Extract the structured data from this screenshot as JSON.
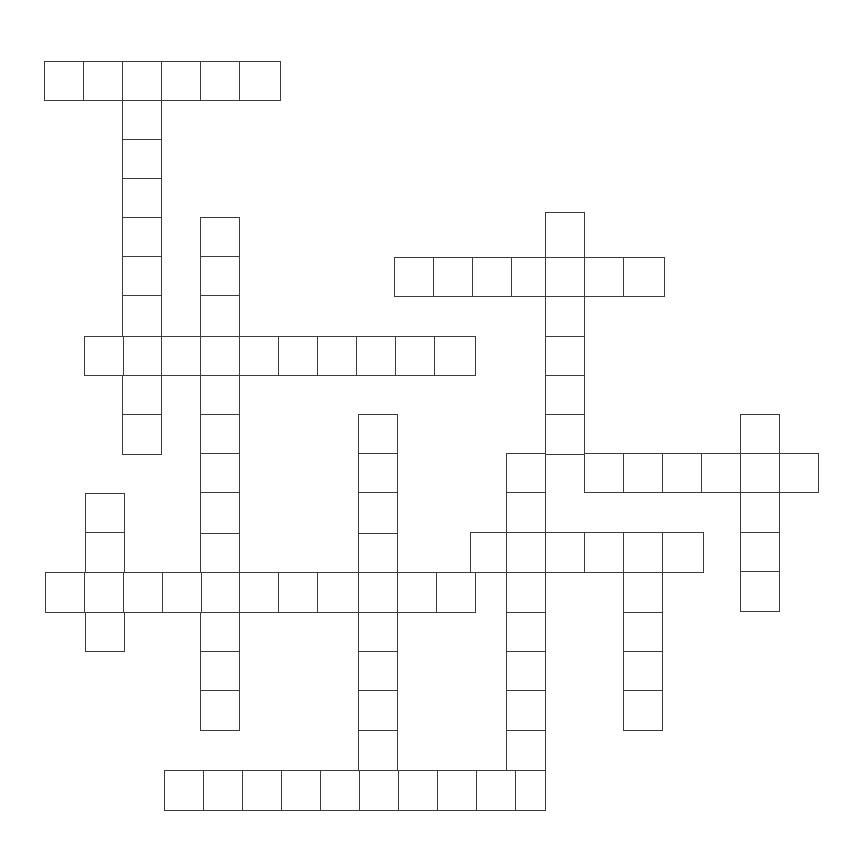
{
  "puzzle": {
    "type": "crossword-grid",
    "title": "Crossword Puzzle Grid",
    "description": "Blank crossword puzzle skeleton with interlocking across and down entries",
    "canvas": {
      "width": 855,
      "height": 854
    },
    "geometry": {
      "cell_size": 39.4,
      "origin_x": 44,
      "origin_y": 61,
      "line_color": "#3a3a3a",
      "cell_fill": "#ffffff",
      "page_background": "#ffffff",
      "border_width": 1.4
    },
    "counts": {
      "across_entries": 7,
      "down_entries": 9,
      "total_cells": 109
    },
    "entries": [
      {
        "id": "a1",
        "direction": "across",
        "col": 0,
        "row": 0,
        "length": 6,
        "x": 44,
        "y": 61
      },
      {
        "id": "a2",
        "direction": "across",
        "col": 9,
        "row": 5,
        "length": 7,
        "x": 398,
        "y": 258
      },
      {
        "id": "a3",
        "direction": "across",
        "col": 1,
        "row": 7,
        "length": 10,
        "x": 84,
        "y": 337
      },
      {
        "id": "a4",
        "direction": "across",
        "col": 12,
        "row": 10,
        "length": 8,
        "x": 516,
        "y": 455
      },
      {
        "id": "a5",
        "direction": "across",
        "col": 11,
        "row": 12,
        "length": 6,
        "x": 477,
        "y": 534
      },
      {
        "id": "a6",
        "direction": "across",
        "col": 0,
        "row": 13,
        "length": 11,
        "x": 44,
        "y": 573
      },
      {
        "id": "a7",
        "direction": "across",
        "col": 3,
        "row": 18,
        "length": 10,
        "x": 162,
        "y": 770
      },
      {
        "id": "d1",
        "direction": "down",
        "col": 2,
        "row": 0,
        "length": 10,
        "x": 122,
        "y": 61
      },
      {
        "id": "d2",
        "direction": "down",
        "col": 4,
        "row": 4,
        "length": 13,
        "x": 201,
        "y": 218
      },
      {
        "id": "d3",
        "direction": "down",
        "col": 13,
        "row": 4,
        "length": 14,
        "x": 516,
        "y": 218
      },
      {
        "id": "d4",
        "direction": "down",
        "col": 8,
        "row": 9,
        "length": 10,
        "x": 359,
        "y": 416
      },
      {
        "id": "d5",
        "direction": "down",
        "col": 18,
        "row": 9,
        "length": 5,
        "x": 753,
        "y": 416
      },
      {
        "id": "d6",
        "direction": "down",
        "col": 1,
        "row": 11,
        "length": 4,
        "x": 84,
        "y": 494
      },
      {
        "id": "d7",
        "direction": "down",
        "col": 15,
        "row": 13,
        "length": 6,
        "x": 595,
        "y": 573
      }
    ],
    "cells": [
      {
        "x": 44,
        "y": 61,
        "w": 40,
        "h": 40
      },
      {
        "x": 83,
        "y": 61,
        "w": 40,
        "h": 40
      },
      {
        "x": 122,
        "y": 61,
        "w": 40,
        "h": 40
      },
      {
        "x": 161,
        "y": 61,
        "w": 40,
        "h": 40
      },
      {
        "x": 200,
        "y": 61,
        "w": 40,
        "h": 40
      },
      {
        "x": 239,
        "y": 61,
        "w": 42,
        "h": 40
      },
      {
        "x": 122,
        "y": 100,
        "w": 40,
        "h": 40
      },
      {
        "x": 122,
        "y": 139,
        "w": 40,
        "h": 40
      },
      {
        "x": 122,
        "y": 178,
        "w": 40,
        "h": 40
      },
      {
        "x": 122,
        "y": 217,
        "w": 40,
        "h": 40
      },
      {
        "x": 122,
        "y": 256,
        "w": 40,
        "h": 40
      },
      {
        "x": 122,
        "y": 295,
        "w": 40,
        "h": 42
      },
      {
        "x": 122,
        "y": 336,
        "w": 40,
        "h": 40
      },
      {
        "x": 122,
        "y": 375,
        "w": 40,
        "h": 40
      },
      {
        "x": 122,
        "y": 414,
        "w": 40,
        "h": 41
      },
      {
        "x": 200,
        "y": 217,
        "w": 40,
        "h": 40
      },
      {
        "x": 200,
        "y": 256,
        "w": 40,
        "h": 40
      },
      {
        "x": 200,
        "y": 295,
        "w": 40,
        "h": 42
      },
      {
        "x": 200,
        "y": 336,
        "w": 40,
        "h": 40
      },
      {
        "x": 200,
        "y": 375,
        "w": 40,
        "h": 40
      },
      {
        "x": 200,
        "y": 414,
        "w": 40,
        "h": 40
      },
      {
        "x": 200,
        "y": 453,
        "w": 40,
        "h": 40
      },
      {
        "x": 200,
        "y": 492,
        "w": 40,
        "h": 42
      },
      {
        "x": 200,
        "y": 533,
        "w": 40,
        "h": 40
      },
      {
        "x": 200,
        "y": 572,
        "w": 40,
        "h": 41
      },
      {
        "x": 200,
        "y": 612,
        "w": 40,
        "h": 40
      },
      {
        "x": 200,
        "y": 651,
        "w": 40,
        "h": 40
      },
      {
        "x": 200,
        "y": 690,
        "w": 40,
        "h": 41
      },
      {
        "x": 394,
        "y": 257,
        "w": 40,
        "h": 40
      },
      {
        "x": 433,
        "y": 257,
        "w": 40,
        "h": 40
      },
      {
        "x": 472,
        "y": 257,
        "w": 40,
        "h": 40
      },
      {
        "x": 511,
        "y": 257,
        "w": 40,
        "h": 40
      },
      {
        "x": 545,
        "y": 257,
        "w": 40,
        "h": 40
      },
      {
        "x": 584,
        "y": 257,
        "w": 40,
        "h": 40
      },
      {
        "x": 623,
        "y": 257,
        "w": 42,
        "h": 40
      },
      {
        "x": 545,
        "y": 212,
        "w": 40,
        "h": 46
      },
      {
        "x": 545,
        "y": 296,
        "w": 40,
        "h": 41
      },
      {
        "x": 545,
        "y": 336,
        "w": 40,
        "h": 40
      },
      {
        "x": 545,
        "y": 375,
        "w": 40,
        "h": 40
      },
      {
        "x": 545,
        "y": 414,
        "w": 40,
        "h": 41
      },
      {
        "x": 84,
        "y": 336,
        "w": 40,
        "h": 40
      },
      {
        "x": 161,
        "y": 336,
        "w": 40,
        "h": 40
      },
      {
        "x": 239,
        "y": 336,
        "w": 40,
        "h": 40
      },
      {
        "x": 278,
        "y": 336,
        "w": 40,
        "h": 40
      },
      {
        "x": 317,
        "y": 336,
        "w": 40,
        "h": 40
      },
      {
        "x": 356,
        "y": 336,
        "w": 40,
        "h": 40
      },
      {
        "x": 395,
        "y": 336,
        "w": 40,
        "h": 40
      },
      {
        "x": 434,
        "y": 336,
        "w": 42,
        "h": 40
      },
      {
        "x": 358,
        "y": 414,
        "w": 40,
        "h": 41
      },
      {
        "x": 358,
        "y": 453,
        "w": 40,
        "h": 40
      },
      {
        "x": 358,
        "y": 492,
        "w": 40,
        "h": 42
      },
      {
        "x": 358,
        "y": 533,
        "w": 40,
        "h": 40
      },
      {
        "x": 358,
        "y": 572,
        "w": 40,
        "h": 41
      },
      {
        "x": 358,
        "y": 612,
        "w": 40,
        "h": 40
      },
      {
        "x": 358,
        "y": 651,
        "w": 40,
        "h": 40
      },
      {
        "x": 358,
        "y": 690,
        "w": 40,
        "h": 41
      },
      {
        "x": 358,
        "y": 730,
        "w": 40,
        "h": 41
      },
      {
        "x": 506,
        "y": 453,
        "w": 40,
        "h": 40
      },
      {
        "x": 584,
        "y": 453,
        "w": 40,
        "h": 40
      },
      {
        "x": 623,
        "y": 453,
        "w": 40,
        "h": 40
      },
      {
        "x": 662,
        "y": 453,
        "w": 40,
        "h": 40
      },
      {
        "x": 701,
        "y": 453,
        "w": 40,
        "h": 40
      },
      {
        "x": 740,
        "y": 453,
        "w": 40,
        "h": 40
      },
      {
        "x": 779,
        "y": 453,
        "w": 40,
        "h": 40
      },
      {
        "x": 740,
        "y": 414,
        "w": 40,
        "h": 40
      },
      {
        "x": 740,
        "y": 492,
        "w": 40,
        "h": 41
      },
      {
        "x": 740,
        "y": 532,
        "w": 40,
        "h": 40
      },
      {
        "x": 740,
        "y": 571,
        "w": 40,
        "h": 41
      },
      {
        "x": 470,
        "y": 532,
        "w": 40,
        "h": 41
      },
      {
        "x": 506,
        "y": 532,
        "w": 40,
        "h": 41
      },
      {
        "x": 545,
        "y": 532,
        "w": 40,
        "h": 41
      },
      {
        "x": 584,
        "y": 532,
        "w": 40,
        "h": 41
      },
      {
        "x": 623,
        "y": 532,
        "w": 40,
        "h": 41
      },
      {
        "x": 662,
        "y": 532,
        "w": 42,
        "h": 41
      },
      {
        "x": 506,
        "y": 492,
        "w": 40,
        "h": 41
      },
      {
        "x": 506,
        "y": 572,
        "w": 40,
        "h": 41
      },
      {
        "x": 506,
        "y": 612,
        "w": 40,
        "h": 40
      },
      {
        "x": 506,
        "y": 651,
        "w": 40,
        "h": 40
      },
      {
        "x": 506,
        "y": 690,
        "w": 40,
        "h": 41
      },
      {
        "x": 506,
        "y": 730,
        "w": 40,
        "h": 41
      },
      {
        "x": 45,
        "y": 572,
        "w": 40,
        "h": 41
      },
      {
        "x": 84,
        "y": 572,
        "w": 40,
        "h": 41
      },
      {
        "x": 123,
        "y": 572,
        "w": 40,
        "h": 41
      },
      {
        "x": 162,
        "y": 572,
        "w": 40,
        "h": 41
      },
      {
        "x": 239,
        "y": 572,
        "w": 40,
        "h": 41
      },
      {
        "x": 278,
        "y": 572,
        "w": 40,
        "h": 41
      },
      {
        "x": 317,
        "y": 572,
        "w": 42,
        "h": 41
      },
      {
        "x": 397,
        "y": 572,
        "w": 40,
        "h": 41
      },
      {
        "x": 436,
        "y": 572,
        "w": 40,
        "h": 41
      },
      {
        "x": 85,
        "y": 493,
        "w": 40,
        "h": 40
      },
      {
        "x": 85,
        "y": 532,
        "w": 40,
        "h": 41
      },
      {
        "x": 85,
        "y": 612,
        "w": 40,
        "h": 40
      },
      {
        "x": 623,
        "y": 572,
        "w": 40,
        "h": 41
      },
      {
        "x": 623,
        "y": 612,
        "w": 40,
        "h": 40
      },
      {
        "x": 623,
        "y": 651,
        "w": 40,
        "h": 40
      },
      {
        "x": 623,
        "y": 690,
        "w": 40,
        "h": 41
      },
      {
        "x": 164,
        "y": 770,
        "w": 40,
        "h": 41
      },
      {
        "x": 203,
        "y": 770,
        "w": 40,
        "h": 41
      },
      {
        "x": 242,
        "y": 770,
        "w": 40,
        "h": 41
      },
      {
        "x": 281,
        "y": 770,
        "w": 40,
        "h": 41
      },
      {
        "x": 320,
        "y": 770,
        "w": 40,
        "h": 41
      },
      {
        "x": 359,
        "y": 770,
        "w": 40,
        "h": 41
      },
      {
        "x": 398,
        "y": 770,
        "w": 40,
        "h": 41
      },
      {
        "x": 437,
        "y": 770,
        "w": 40,
        "h": 41
      },
      {
        "x": 476,
        "y": 770,
        "w": 40,
        "h": 41
      },
      {
        "x": 515,
        "y": 770,
        "w": 31,
        "h": 41
      }
    ]
  }
}
